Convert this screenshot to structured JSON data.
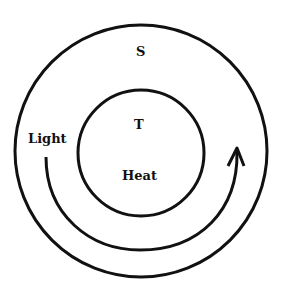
{
  "diagram": {
    "outer_label": "S",
    "inner_label": "T",
    "inner_sublabel": "Heat",
    "arrow_label": "Light",
    "stroke_color": "#111111",
    "background_color": "#ffffff"
  }
}
